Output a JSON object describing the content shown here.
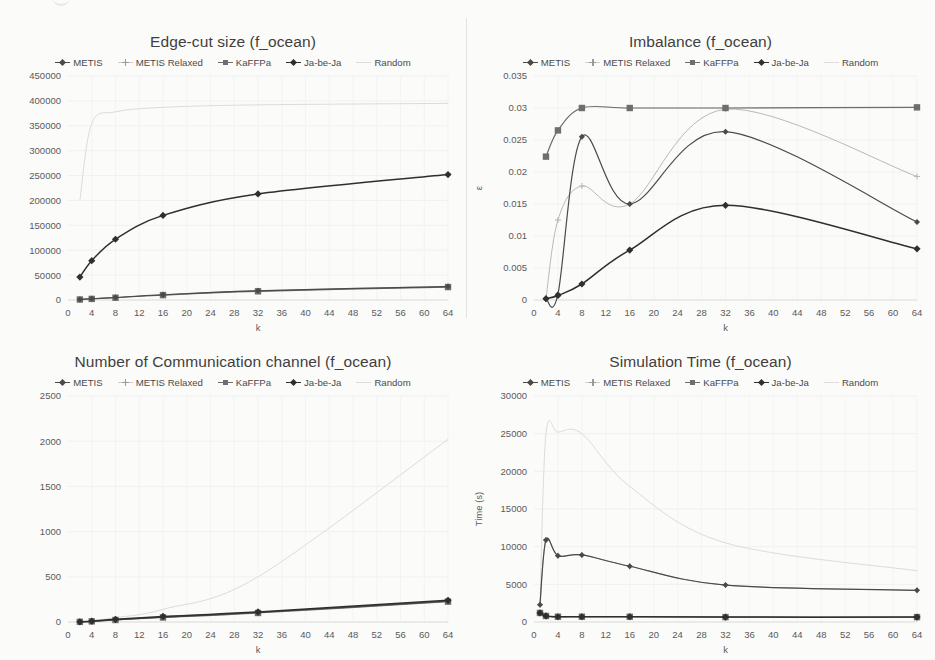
{
  "figure": {
    "series_names": [
      "METIS",
      "METIS Relaxed",
      "KaFFPa",
      "Ja-be-Ja",
      "Random"
    ],
    "x_axis_label": "k",
    "colors": {
      "METIS": "#4a4a4a",
      "METIS Relaxed": "#b9b9b9",
      "KaFFPa": "#6e6e6e",
      "Ja-be-Ja": "#2f2f2f",
      "Random": "#dcdcdc",
      "background": "#fbfbfa",
      "grid": "#ededed",
      "text": "#4a4a4a"
    }
  },
  "chart_data": [
    {
      "id": "edge-cut",
      "type": "line",
      "title": "Edge-cut size (f_ocean)",
      "xlabel": "k",
      "ylabel": "",
      "xlim": [
        0,
        64
      ],
      "ylim": [
        0,
        450000
      ],
      "xticks": [
        0,
        4,
        8,
        12,
        16,
        20,
        24,
        28,
        32,
        36,
        40,
        44,
        48,
        52,
        56,
        60,
        64
      ],
      "yticks": [
        0,
        50000,
        100000,
        150000,
        200000,
        250000,
        300000,
        350000,
        400000,
        450000
      ],
      "grid": true,
      "legend_position": "top",
      "x": [
        2,
        4,
        8,
        16,
        32,
        64
      ],
      "series": [
        {
          "name": "METIS",
          "values": [
            1200,
            2500,
            5000,
            10500,
            18500,
            27000
          ]
        },
        {
          "name": "METIS Relaxed",
          "values": [
            1300,
            2600,
            5200,
            10800,
            18800,
            27500
          ]
        },
        {
          "name": "KaFFPa",
          "values": [
            1000,
            2200,
            4600,
            9800,
            17500,
            26000
          ]
        },
        {
          "name": "Ja-be-Ja",
          "values": [
            46000,
            79000,
            122000,
            170000,
            213000,
            252000
          ]
        },
        {
          "name": "Random",
          "values": [
            200000,
            355000,
            378000,
            387000,
            392000,
            395000
          ]
        }
      ]
    },
    {
      "id": "imbalance",
      "type": "line",
      "title": "Imbalance (f_ocean)",
      "xlabel": "k",
      "ylabel": "ε",
      "xlim": [
        0,
        64
      ],
      "ylim": [
        0,
        0.035
      ],
      "xticks": [
        0,
        4,
        8,
        12,
        16,
        20,
        24,
        28,
        32,
        36,
        40,
        44,
        48,
        52,
        56,
        60,
        64
      ],
      "yticks": [
        0,
        0.005,
        0.01,
        0.015,
        0.02,
        0.025,
        0.03,
        0.035
      ],
      "grid": true,
      "legend_position": "top",
      "x": [
        2,
        4,
        8,
        16,
        32,
        64
      ],
      "series": [
        {
          "name": "METIS",
          "values": [
            0.0002,
            0.0009,
            0.0255,
            0.015,
            0.0263,
            0.0122
          ]
        },
        {
          "name": "METIS Relaxed",
          "values": [
            0.0002,
            0.0125,
            0.0178,
            0.015,
            0.0298,
            0.0193
          ]
        },
        {
          "name": "KaFFPa",
          "values": [
            0.0224,
            0.0265,
            0.03,
            0.03,
            0.03,
            0.0301
          ]
        },
        {
          "name": "Ja-be-Ja",
          "values": [
            0.0002,
            0.0007,
            0.0025,
            0.0078,
            0.0148,
            0.008
          ]
        },
        {
          "name": "Random",
          "values": [
            0.0224,
            0.0265,
            0.03,
            0.03,
            0.03,
            0.0301
          ]
        }
      ]
    },
    {
      "id": "comm-channels",
      "type": "line",
      "title": "Number of Communication channel (f_ocean)",
      "xlabel": "k",
      "ylabel": "",
      "xlim": [
        0,
        64
      ],
      "ylim": [
        0,
        2500
      ],
      "xticks": [
        0,
        4,
        8,
        12,
        16,
        20,
        24,
        28,
        32,
        36,
        40,
        44,
        48,
        52,
        56,
        60,
        64
      ],
      "yticks": [
        0,
        500,
        1000,
        1500,
        2000,
        2500
      ],
      "grid": true,
      "legend_position": "top",
      "x": [
        2,
        4,
        8,
        16,
        32,
        64
      ],
      "series": [
        {
          "name": "METIS",
          "values": [
            2,
            8,
            24,
            55,
            105,
            230
          ]
        },
        {
          "name": "METIS Relaxed",
          "values": [
            2,
            8,
            26,
            58,
            108,
            235
          ]
        },
        {
          "name": "KaFFPa",
          "values": [
            2,
            7,
            22,
            50,
            100,
            225
          ]
        },
        {
          "name": "Ja-be-Ja",
          "values": [
            2,
            9,
            30,
            62,
            112,
            240
          ]
        },
        {
          "name": "Random",
          "values": [
            2,
            12,
            48,
            140,
            500,
            2020
          ]
        }
      ]
    },
    {
      "id": "simulation-time",
      "type": "line",
      "title": "Simulation Time (f_ocean)",
      "xlabel": "k",
      "ylabel": "Time (s)",
      "xlim": [
        0,
        64
      ],
      "ylim": [
        0,
        30000
      ],
      "xticks": [
        0,
        4,
        8,
        12,
        16,
        20,
        24,
        28,
        32,
        36,
        40,
        44,
        48,
        52,
        56,
        60,
        64
      ],
      "yticks": [
        0,
        5000,
        10000,
        15000,
        20000,
        25000,
        30000
      ],
      "grid": true,
      "legend_position": "top",
      "x": [
        1,
        2,
        4,
        8,
        16,
        32,
        64
      ],
      "series": [
        {
          "name": "METIS",
          "values": [
            2300,
            10900,
            8800,
            8900,
            7400,
            4900,
            4200
          ]
        },
        {
          "name": "METIS Relaxed",
          "values": [
            2300,
            10900,
            8800,
            8900,
            7400,
            4900,
            4200
          ]
        },
        {
          "name": "KaFFPa",
          "values": [
            1200,
            800,
            700,
            700,
            700,
            650,
            650
          ]
        },
        {
          "name": "Ja-be-Ja",
          "values": [
            1200,
            800,
            700,
            700,
            700,
            650,
            650
          ]
        },
        {
          "name": "Random",
          "values": [
            2300,
            25000,
            25200,
            25000,
            18000,
            10500,
            6800
          ]
        }
      ]
    }
  ]
}
